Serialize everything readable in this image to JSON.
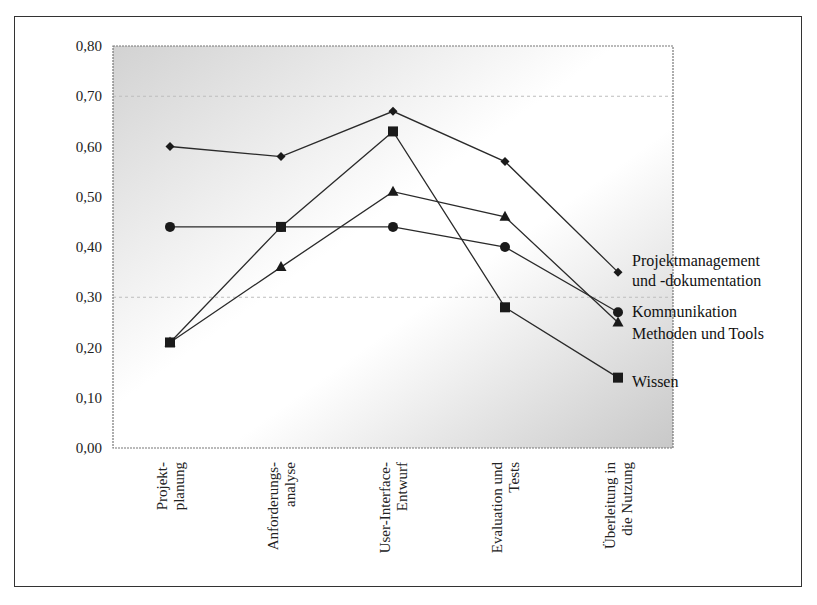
{
  "chart_data": {
    "type": "line",
    "title": "",
    "xlabel": "",
    "ylabel": "",
    "ylim": [
      0,
      0.8
    ],
    "y_ticks": [
      "0,00",
      "0,10",
      "0,20",
      "0,30",
      "0,40",
      "0,50",
      "0,60",
      "0,70",
      "0,80"
    ],
    "categories": [
      [
        "Projekt-",
        "planung"
      ],
      [
        "Anforderungs-",
        "analyse"
      ],
      [
        "User-Interface-",
        "Entwurf"
      ],
      [
        "Evaluation und",
        "Tests"
      ],
      [
        "Überleitung in",
        "die Nutzung"
      ]
    ],
    "grid": "dashed at 0,30 and 0,70",
    "legend_position": "right, at line ends",
    "series": [
      {
        "name": "Projektmanagement und -dokumentation",
        "label_lines": [
          "Projektmanagement",
          "und -dokumentation"
        ],
        "marker": "diamond",
        "values": [
          0.6,
          0.58,
          0.67,
          0.57,
          0.35
        ]
      },
      {
        "name": "Kommunikation",
        "label_lines": [
          "Kommunikation"
        ],
        "marker": "circle",
        "values": [
          0.44,
          0.44,
          0.44,
          0.4,
          0.27
        ]
      },
      {
        "name": "Methoden und Tools",
        "label_lines": [
          "Methoden und Tools"
        ],
        "marker": "triangle",
        "values": [
          0.21,
          0.36,
          0.51,
          0.46,
          0.25
        ]
      },
      {
        "name": "Wissen",
        "label_lines": [
          "Wissen"
        ],
        "marker": "square",
        "values": [
          0.21,
          0.44,
          0.63,
          0.28,
          0.14
        ]
      }
    ],
    "colors": {
      "line": "#2a2a2a",
      "marker": "#1a1a1a",
      "plot_gradient_edge": "#cfcfcf",
      "plot_gradient_mid": "#ffffff"
    }
  }
}
